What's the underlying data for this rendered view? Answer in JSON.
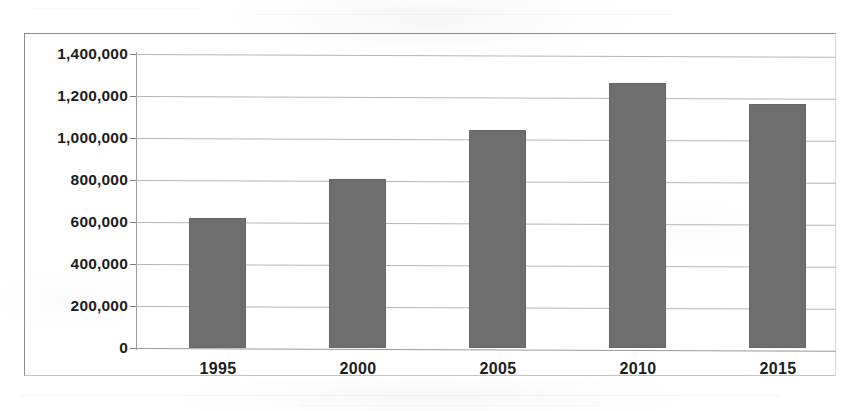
{
  "chart_data": {
    "type": "bar",
    "title": "",
    "subtitle": "",
    "xlabel": "",
    "ylabel": "",
    "categories": [
      "1995",
      "2000",
      "2005",
      "2010",
      "2015"
    ],
    "values": [
      620000,
      805000,
      1040000,
      1260000,
      1160000
    ],
    "series": [
      {
        "name": "",
        "values": [
          620000,
          805000,
          1040000,
          1260000,
          1160000
        ]
      }
    ],
    "ylim": [
      0,
      1400000
    ],
    "y_tick_step": 200000,
    "y_tick_labels": [
      "1,400,000",
      "1,200,000",
      "1,000,000",
      "800,000",
      "600,000",
      "400,000",
      "200,000",
      "0"
    ],
    "y_tick_values": [
      1400000,
      1200000,
      1000000,
      800000,
      600000,
      400000,
      200000,
      0
    ],
    "grid": true,
    "grid_orientation": "horizontal",
    "legend": false,
    "legend_position": "none",
    "bar_color": "#6e6e6e",
    "grid_color": "#b6b6b6",
    "axis_color": "#9a9a9a",
    "text_color": "#1c1c1c",
    "background_color": "#ffffff"
  }
}
